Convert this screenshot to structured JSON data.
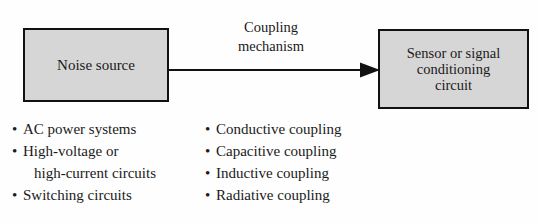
{
  "figure": {
    "colors": {
      "box_fill": "#d6d6d6",
      "box_border": "#111111",
      "background": "#fefefe",
      "text": "#1a1a1a"
    },
    "source_block": {
      "lines": [
        "Noise source"
      ]
    },
    "target_block": {
      "lines": [
        "Sensor or signal",
        "conditioning",
        "circuit"
      ]
    },
    "connector": {
      "label_lines": [
        "Coupling",
        "mechanism"
      ],
      "arrow_direction": "left-to-right"
    },
    "noise_sources": {
      "items": [
        {
          "text": "AC power systems",
          "continuation": ""
        },
        {
          "text": "High-voltage or",
          "continuation": "high-current circuits"
        },
        {
          "text": "Switching circuits",
          "continuation": ""
        }
      ]
    },
    "coupling_types": {
      "items": [
        {
          "text": "Conductive coupling",
          "continuation": ""
        },
        {
          "text": "Capacitive coupling",
          "continuation": ""
        },
        {
          "text": "Inductive coupling",
          "continuation": ""
        },
        {
          "text": "Radiative coupling",
          "continuation": ""
        }
      ]
    },
    "bullet_glyph": "•"
  }
}
